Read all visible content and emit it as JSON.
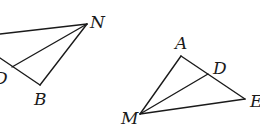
{
  "figure_left": {
    "labels": {
      "N": "N",
      "D": "D",
      "B": "B"
    }
  },
  "figure_right": {
    "labels": {
      "A": "A",
      "D": "D",
      "E": "E",
      "M": "M"
    }
  }
}
